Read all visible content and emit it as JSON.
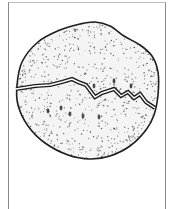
{
  "figure": {
    "colors": {
      "background": "#ffffff",
      "outline": "#1e1e1e",
      "stipple": "#3a3a3a",
      "frame": "#8a8a8a"
    },
    "outline_points": [
      [
        17,
        85
      ],
      [
        22,
        62
      ],
      [
        38,
        42
      ],
      [
        60,
        30
      ],
      [
        80,
        24
      ],
      [
        95,
        22
      ],
      [
        110,
        26
      ],
      [
        124,
        36
      ],
      [
        140,
        45
      ],
      [
        152,
        56
      ],
      [
        158,
        72
      ],
      [
        158,
        95
      ],
      [
        154,
        115
      ],
      [
        146,
        130
      ],
      [
        130,
        146
      ],
      [
        110,
        156
      ],
      [
        90,
        159
      ],
      [
        68,
        155
      ],
      [
        45,
        143
      ],
      [
        28,
        126
      ],
      [
        18,
        105
      ]
    ],
    "crack_points": [
      [
        16,
        89
      ],
      [
        35,
        86
      ],
      [
        50,
        85
      ],
      [
        62,
        82
      ],
      [
        72,
        79
      ],
      [
        78,
        82
      ],
      [
        86,
        85
      ],
      [
        95,
        97
      ],
      [
        102,
        93
      ],
      [
        108,
        91
      ],
      [
        114,
        89
      ],
      [
        121,
        96
      ],
      [
        128,
        92
      ],
      [
        134,
        98
      ],
      [
        140,
        94
      ],
      [
        146,
        102
      ],
      [
        155,
        108
      ]
    ],
    "dark_marks": [
      [
        48,
        111
      ],
      [
        70,
        114
      ],
      [
        83,
        116
      ],
      [
        99,
        117
      ],
      [
        61,
        108
      ],
      [
        94,
        86
      ],
      [
        114,
        81
      ],
      [
        131,
        86
      ]
    ]
  }
}
